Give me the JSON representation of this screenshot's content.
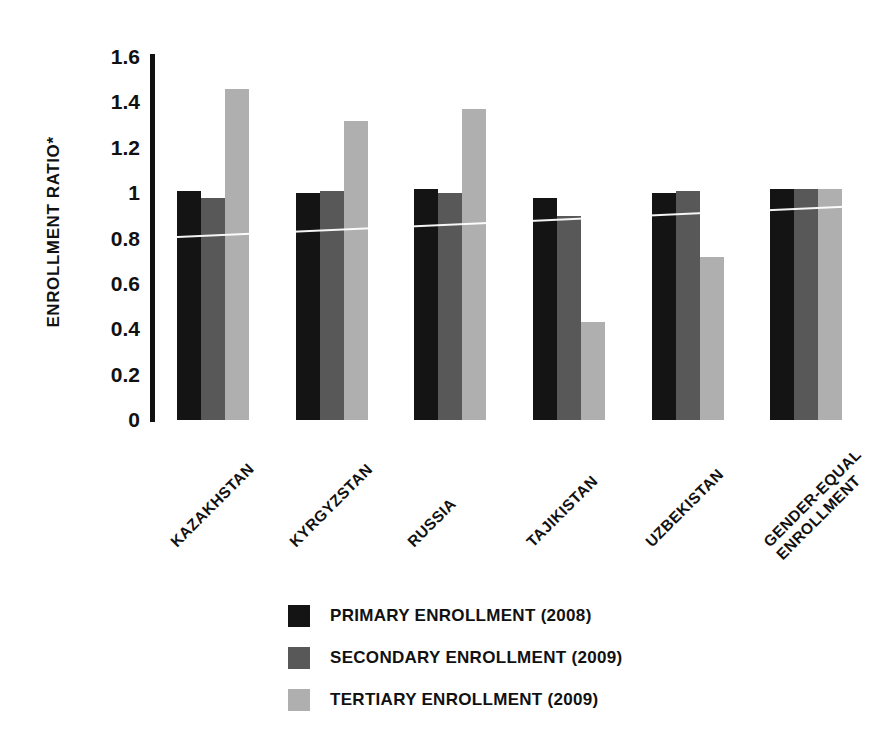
{
  "chart_data": {
    "type": "bar",
    "title": "",
    "xlabel": "",
    "ylabel": "ENROLLMENT RATIO*",
    "ylim": [
      0,
      1.6
    ],
    "yticks": [
      "0",
      "0.2",
      "0.4",
      "0.6",
      "0.8",
      "1",
      "1.2",
      "1.4",
      "1.6"
    ],
    "ytick_values": [
      0,
      0.2,
      0.4,
      0.6,
      0.8,
      1,
      1.2,
      1.4,
      1.6
    ],
    "grid": false,
    "legend_position": "bottom-center",
    "categories": [
      "KAZAKHSTAN",
      "KYRGYZSTAN",
      "RUSSIA",
      "TAJIKISTAN",
      "UZBEKISTAN",
      "GENDER-EQUAL\nENROLLMENT"
    ],
    "series": [
      {
        "name": "PRIMARY ENROLLMENT (2008)",
        "color": "#141414",
        "values": [
          1.01,
          1.0,
          1.02,
          0.98,
          1.0,
          1.02
        ]
      },
      {
        "name": "SECONDARY ENROLLMENT (2009)",
        "color": "#585858",
        "values": [
          0.98,
          1.01,
          1.0,
          0.9,
          1.01,
          1.02
        ]
      },
      {
        "name": "TERTIARY ENROLLMENT (2009)",
        "color": "#afafaf",
        "values": [
          1.46,
          1.32,
          1.37,
          0.43,
          0.72,
          1.02
        ]
      }
    ],
    "annotations": [
      {
        "name": "gender-parity-reference-line",
        "description": "thin white reference line drawn across the bars near a ratio of 1.0"
      }
    ]
  },
  "axis": {
    "y_title": "ENROLLMENT RATIO*"
  },
  "legend": {
    "items": [
      {
        "label": "PRIMARY ENROLLMENT (2008)",
        "color": "#141414"
      },
      {
        "label": "SECONDARY ENROLLMENT (2009)",
        "color": "#585858"
      },
      {
        "label": "TERTIARY ENROLLMENT (2009)",
        "color": "#afafaf"
      }
    ]
  }
}
